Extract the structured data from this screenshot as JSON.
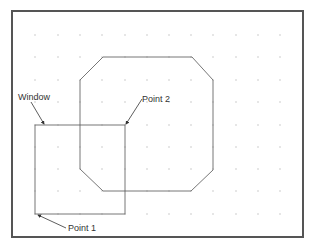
{
  "diagram": {
    "frame": {
      "x": 12,
      "y": 11,
      "width": 291,
      "height": 226,
      "stroke": "#555555"
    },
    "grid": {
      "xs": [
        35,
        58,
        80,
        102,
        125,
        147,
        169,
        191,
        213,
        236,
        258,
        280
      ],
      "ys": [
        35,
        57,
        80,
        102,
        125,
        147,
        169,
        191,
        214
      ],
      "dot_color": "#bbbbbb"
    },
    "octagon": {
      "points": "80,80 103,57 192,57 213,80 213,170 191,191 103,191 80,169",
      "stroke": "#777777"
    },
    "window_rect": {
      "x": 35,
      "y": 125,
      "width": 90,
      "height": 89,
      "stroke": "#777777"
    },
    "labels": {
      "window": "Window",
      "point2": "Point 2",
      "point1": "Point 1"
    },
    "leaders": {
      "window": {
        "x1": 31,
        "y1": 102,
        "x2": 44,
        "y2": 124
      },
      "point2": {
        "x1": 142,
        "y1": 99,
        "x2": 126,
        "y2": 124
      },
      "point1": {
        "x1": 66,
        "y1": 228,
        "x2": 38,
        "y2": 215
      }
    }
  }
}
